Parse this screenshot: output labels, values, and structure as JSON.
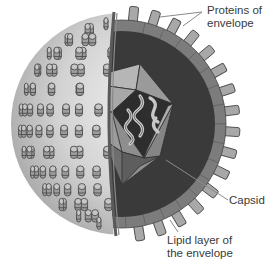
{
  "diagram": {
    "labels": {
      "proteins": {
        "line1": "Proteins of",
        "line2": "envelope"
      },
      "capsid": "Capsid",
      "lipid": {
        "line1": "Lipid layer of",
        "line2": "the envelope"
      }
    },
    "colors": {
      "background": "#ffffff",
      "sphere_light": "#e6e6e6",
      "sphere_dark": "#9a9a9a",
      "spike_fill": "#a8a8a8",
      "spike_stroke": "#4a4a4a",
      "lipid_ring": "#7a7a7a",
      "inner_dark": "#3a3a3a",
      "capsid_light": "#b4b4b4",
      "capsid_mid": "#8e8e8e",
      "capsid_dark": "#5e5e5e",
      "core": "#2e2e2e",
      "rna": "#c8c8c8",
      "leader": "#888888",
      "text": "#3a3a3a"
    }
  }
}
